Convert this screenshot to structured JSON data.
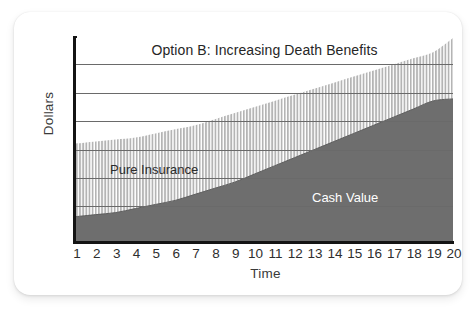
{
  "chart_data": {
    "type": "area",
    "title": "Option B: Increasing Death Benefits",
    "xlabel": "Time",
    "ylabel": "Dollars",
    "stacked": true,
    "grid": true,
    "legend_position": "inline-annotations",
    "xlim": [
      1,
      20
    ],
    "ylim": [
      0,
      100
    ],
    "x": [
      1,
      2,
      3,
      4,
      5,
      6,
      7,
      8,
      9,
      10,
      11,
      12,
      13,
      14,
      15,
      16,
      17,
      18,
      19,
      20
    ],
    "xticklabels": [
      "1",
      "2",
      "3",
      "4",
      "5",
      "6",
      "7",
      "8",
      "9",
      "10",
      "11",
      "12",
      "13",
      "14",
      "15",
      "16",
      "17",
      "18",
      "19",
      "20"
    ],
    "yticklabels": [],
    "series": [
      {
        "name": "Cash Value",
        "fill": "#6e6e6e",
        "pattern": "solid",
        "label_color": "#ffffff",
        "values": [
          12,
          13,
          14,
          16,
          18,
          20,
          23,
          26,
          29,
          33,
          37,
          41,
          45,
          49,
          53,
          57,
          61,
          65,
          69,
          70
        ]
      },
      {
        "name": "Pure Insurance",
        "fill": "#ffffff",
        "pattern": "vertical-hatch",
        "hatch_color": "#b4b4b4",
        "label_color": "#2b2b2b",
        "values": [
          36,
          36,
          36,
          35,
          35,
          35,
          34,
          34,
          34,
          33,
          32,
          31,
          30,
          29,
          28,
          27,
          26,
          25,
          24,
          30
        ]
      }
    ],
    "total_label": "Option B: Increasing Death Benefits",
    "totals": [
      48,
      49,
      50,
      51,
      53,
      55,
      57,
      60,
      63,
      66,
      69,
      72,
      75,
      78,
      81,
      84,
      87,
      90,
      93,
      100
    ],
    "gridline_values": [
      17,
      31,
      45,
      59,
      73,
      87
    ],
    "annotations": [
      {
        "text": "Option B: Increasing Death Benefits",
        "position": "top-center"
      },
      {
        "text": "Pure Insurance",
        "position": "left-middle"
      },
      {
        "text": "Cash Value",
        "position": "right-lower"
      }
    ]
  },
  "colors": {
    "cash_value_gray": "#6e6e6e",
    "hatch_gray": "#b4b4b4",
    "axis_black": "#141414",
    "gridline_gray": "#6a6a6a",
    "background": "#ffffff"
  }
}
